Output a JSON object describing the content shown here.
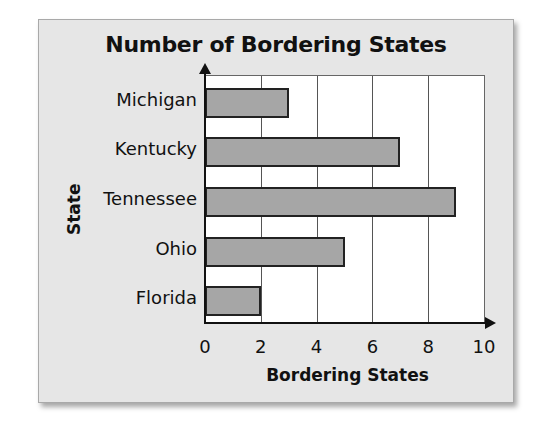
{
  "chart_data": {
    "type": "bar",
    "orientation": "horizontal",
    "title": "Number of Bordering States",
    "xlabel": "Bordering States",
    "ylabel": "State",
    "categories": [
      "Michigan",
      "Kentucky",
      "Tennessee",
      "Ohio",
      "Florida"
    ],
    "values": [
      3,
      7,
      9,
      5,
      2
    ],
    "xlim": [
      0,
      10
    ],
    "xticks": [
      "0",
      "2",
      "4",
      "6",
      "8",
      "10"
    ],
    "grid": "vertical lines at 2, 4, 6, 8, 10",
    "bar_color": "#a6a6a6",
    "bar_border": "#222222",
    "background": "#e6e6e6",
    "plot_background": "#ffffff"
  }
}
